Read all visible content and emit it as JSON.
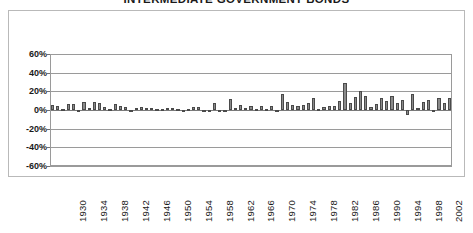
{
  "chart_data": {
    "type": "bar",
    "title": "INTERMEDIATE GOVERNMENT BONDS",
    "xlabel": "",
    "ylabel": "",
    "ylim": [
      -60,
      60
    ],
    "ytick_labels": [
      "60%",
      "40%",
      "20%",
      "0%",
      "-20%",
      "-40%",
      "-60%"
    ],
    "ytick_values": [
      60,
      40,
      20,
      0,
      -20,
      -40,
      -60
    ],
    "grid": true,
    "legend": "none",
    "bar_color": "#8a8a8a",
    "bar_border_color": "#4a4a4a",
    "xtick_label_rotation": -90,
    "xtick_label_interval": 4,
    "xtick_labels": [
      "1930",
      "1934",
      "1938",
      "1942",
      "1946",
      "1950",
      "1954",
      "1958",
      "1962",
      "1966",
      "1970",
      "1974",
      "1978",
      "1982",
      "1986",
      "1990",
      "1994",
      "1998",
      "2002"
    ],
    "categories": [
      "1926",
      "1927",
      "1928",
      "1929",
      "1930",
      "1931",
      "1932",
      "1933",
      "1934",
      "1935",
      "1936",
      "1937",
      "1938",
      "1939",
      "1940",
      "1941",
      "1942",
      "1943",
      "1944",
      "1945",
      "1946",
      "1947",
      "1948",
      "1949",
      "1950",
      "1951",
      "1952",
      "1953",
      "1954",
      "1955",
      "1956",
      "1957",
      "1958",
      "1959",
      "1960",
      "1961",
      "1962",
      "1963",
      "1964",
      "1965",
      "1966",
      "1967",
      "1968",
      "1969",
      "1970",
      "1971",
      "1972",
      "1973",
      "1974",
      "1975",
      "1976",
      "1977",
      "1978",
      "1979",
      "1980",
      "1981",
      "1982",
      "1983",
      "1984",
      "1985",
      "1986",
      "1987",
      "1988",
      "1989",
      "1990",
      "1991",
      "1992",
      "1993",
      "1994",
      "1995",
      "1996",
      "1997",
      "1998",
      "1999",
      "2000",
      "2001",
      "2002"
    ],
    "values": [
      5.4,
      4.5,
      0.9,
      6.0,
      6.7,
      -2.3,
      8.8,
      1.8,
      9.0,
      7.0,
      3.1,
      1.6,
      6.2,
      4.5,
      3.0,
      0.5,
      1.9,
      2.8,
      1.8,
      2.2,
      1.0,
      0.9,
      2.0,
      2.0,
      0.7,
      0.4,
      1.6,
      3.2,
      2.7,
      -0.6,
      -0.4,
      7.8,
      -1.3,
      -0.4,
      11.8,
      2.3,
      5.7,
      1.7,
      4.1,
      1.0,
      4.7,
      1.0,
      4.5,
      -0.7,
      16.9,
      8.7,
      5.2,
      4.6,
      5.7,
      7.8,
      12.9,
      1.4,
      3.5,
      4.1,
      3.9,
      9.5,
      29.1,
      7.4,
      14.0,
      20.3,
      15.1,
      2.9,
      6.1,
      13.3,
      9.7,
      15.5,
      7.2,
      11.2,
      -5.1,
      16.8,
      2.1,
      8.4,
      10.2,
      -1.8,
      12.6,
      7.6,
      12.9
    ],
    "zero_line": 0,
    "y_axis_unit": "percent"
  }
}
